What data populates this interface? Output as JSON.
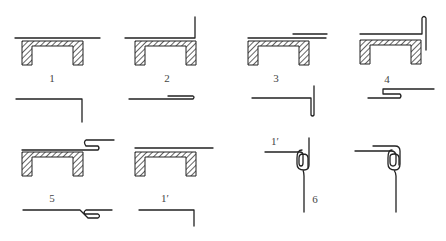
{
  "figure": {
    "type": "seam-folding process diagram",
    "labels": {
      "step1": "1",
      "step2": "2",
      "step3": "3",
      "step4": "4",
      "step5": "5",
      "step1_prime_a": "1′",
      "step1_prime_b": "1′",
      "step6": "6"
    },
    "colors": {
      "line": "#222222",
      "label": "#444444",
      "background": "#ffffff"
    }
  }
}
